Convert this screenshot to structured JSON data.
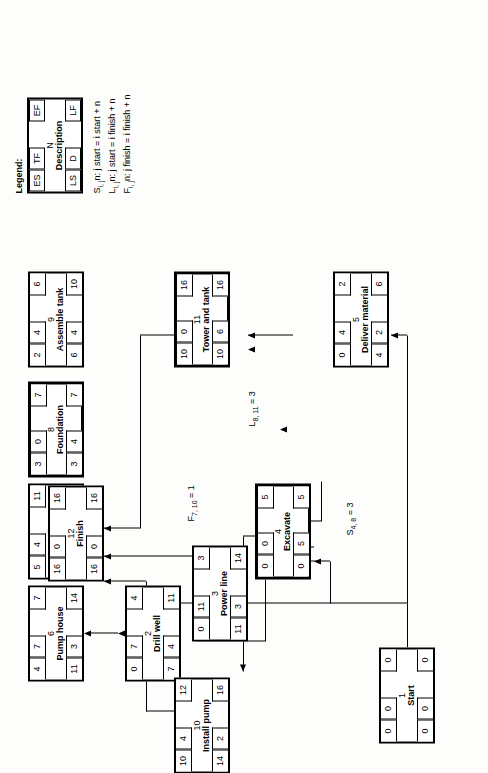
{
  "diagram": {
    "nodes": [
      {
        "id": "start",
        "n": "1",
        "desc": "Start",
        "es": "0",
        "tf": "0",
        "ef": "0",
        "ls": "0",
        "d": "0",
        "lf": "0"
      },
      {
        "id": "drill",
        "n": "2",
        "desc": "Drill well",
        "es": "0",
        "tf": "7",
        "ef": "4",
        "ls": "7",
        "d": "4",
        "lf": "11"
      },
      {
        "id": "power",
        "n": "3",
        "desc": "Power line",
        "es": "0",
        "tf": "11",
        "ef": "3",
        "ls": "11",
        "d": "3",
        "lf": "14"
      },
      {
        "id": "excavate",
        "n": "4",
        "desc": "Excavate",
        "es": "0",
        "tf": "0",
        "ef": "5",
        "ls": "0",
        "d": "5",
        "lf": "5"
      },
      {
        "id": "deliver",
        "n": "5",
        "desc": "Deliver material",
        "es": "0",
        "tf": "4",
        "ef": "2",
        "ls": "4",
        "d": "2",
        "lf": "6"
      },
      {
        "id": "pumphouse",
        "n": "6",
        "desc": "Pump house",
        "es": "4",
        "tf": "7",
        "ef": "7",
        "ls": "11",
        "d": "3",
        "lf": "14"
      },
      {
        "id": "pipe",
        "n": "7",
        "desc": "Install pipe",
        "es": "5",
        "tf": "4",
        "ef": "11",
        "ls": "9",
        "d": "6",
        "lf": "15"
      },
      {
        "id": "foundation",
        "n": "8",
        "desc": "Foundation",
        "es": "3",
        "tf": "0",
        "ef": "7",
        "ls": "3",
        "d": "4",
        "lf": "7"
      },
      {
        "id": "assemble",
        "n": "9",
        "desc": "Assemble tank",
        "es": "2",
        "tf": "4",
        "ef": "6",
        "ls": "6",
        "d": "4",
        "lf": "10"
      },
      {
        "id": "pump",
        "n": "10",
        "desc": "Install pump",
        "es": "10",
        "tf": "4",
        "ef": "12",
        "ls": "14",
        "d": "2",
        "lf": "16"
      },
      {
        "id": "tower",
        "n": "11",
        "desc": "Tower and tank",
        "es": "10",
        "tf": "0",
        "ef": "16",
        "ls": "10",
        "d": "6",
        "lf": "16"
      },
      {
        "id": "finish",
        "n": "12",
        "desc": "Finish",
        "es": "16",
        "tf": "0",
        "ef": "16",
        "ls": "16",
        "d": "0",
        "lf": "16"
      }
    ],
    "lags": [
      {
        "id": "lag-s48",
        "text": "S4, 8 = 3",
        "base": "S",
        "sub": "4, 8",
        "value": "3"
      },
      {
        "id": "lag-f710",
        "text": "F7, 10 = 1",
        "base": "F",
        "sub": "7, 10",
        "value": "1"
      },
      {
        "id": "lag-l811",
        "text": "L8, 11 = 3",
        "base": "L",
        "sub": "8, 11",
        "value": "3"
      }
    ]
  },
  "legend": {
    "title": "Legend:",
    "box": {
      "es": "ES",
      "tf": "TF",
      "ef": "EF",
      "n": "N",
      "desc": "Description",
      "ls": "LS",
      "d": "D",
      "lf": "LF"
    },
    "formulas": [
      {
        "base": "S",
        "sub": "i, j",
        "rest": "n:  j start = i start + n"
      },
      {
        "base": "L",
        "sub": "i, j",
        "rest": "n:  j start = i finish + n"
      },
      {
        "base": "F",
        "sub": "i, j",
        "rest": "n:  j finish = i finish + n"
      }
    ]
  }
}
